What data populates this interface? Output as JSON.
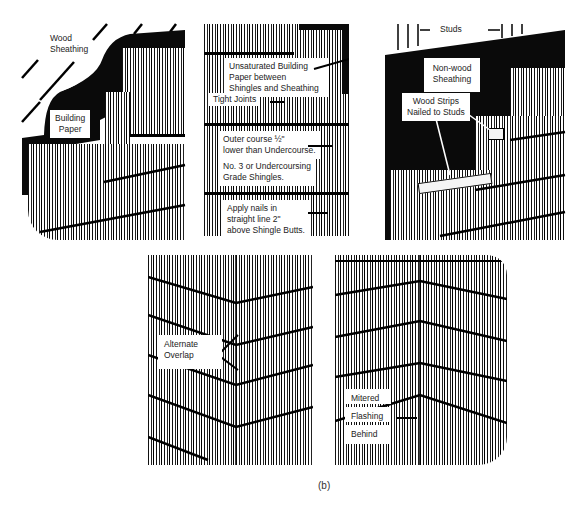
{
  "figure": {
    "caption": "(b)",
    "panels": [
      {
        "id": "panel-wood-sheathing",
        "labels": {
          "wood_sheathing": "Wood\nSheathing",
          "building_paper": "Building\nPaper"
        }
      },
      {
        "id": "panel-undercourse",
        "labels": {
          "unsaturated_paper": "Unsaturated Building\nPaper between\nShingles and Sheathing",
          "tight_joints": "Tight Joints",
          "outer_course": "Outer course ½\"\nlower than Undercourse.",
          "undercoursing_grade": "No. 3 or Undercoursing\nGrade Shingles.",
          "apply_nails": "Apply nails in\nstraight line 2\"\nabove Shingle Butts."
        }
      },
      {
        "id": "panel-nonwood-sheathing",
        "labels": {
          "studs": "Studs",
          "non_wood_sheathing": "Non-wood\nSheathing",
          "wood_strips": "Wood Strips\nNailed to Studs"
        }
      },
      {
        "id": "panel-alternate-overlap",
        "labels": {
          "alternate_overlap": "Alternate\nOverlap"
        }
      },
      {
        "id": "panel-mitered-corner",
        "labels": {
          "mitered": "Mitered",
          "flashing": "Flashing",
          "behind": "Behind"
        }
      }
    ]
  },
  "colors": {
    "ink": "#0a0a0a",
    "paper": "#ffffff",
    "label_text": "#222222"
  }
}
